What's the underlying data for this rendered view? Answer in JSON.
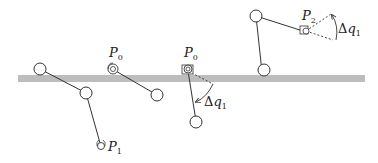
{
  "diagram": {
    "type": "robot-arm-motion-sequence",
    "colors": {
      "line": "#333333",
      "ground": "#bdbdbd",
      "background": "#ffffff"
    },
    "ground_bar": {
      "x": 18,
      "y": 75,
      "width": 347,
      "height": 7
    },
    "labels": {
      "p1": {
        "base": "P",
        "sub": "1"
      },
      "p0_a": {
        "base": "P",
        "sub": "0"
      },
      "p0_b": {
        "base": "P",
        "sub": "0"
      },
      "p2": {
        "base": "P",
        "sub": "2"
      },
      "dq_a": {
        "delta": "Δ",
        "base": "q",
        "sub": "1"
      },
      "dq_b": {
        "delta": "Δ",
        "base": "q",
        "sub": "1"
      }
    },
    "stages": [
      {
        "name": "arm-at-p1",
        "label": "P1"
      },
      {
        "name": "arm-at-p0",
        "label": "P0"
      },
      {
        "name": "arm-rotated-dq1",
        "label": "P0 / Δq1"
      },
      {
        "name": "arm-at-p2",
        "label": "P2 / Δq1"
      }
    ]
  }
}
